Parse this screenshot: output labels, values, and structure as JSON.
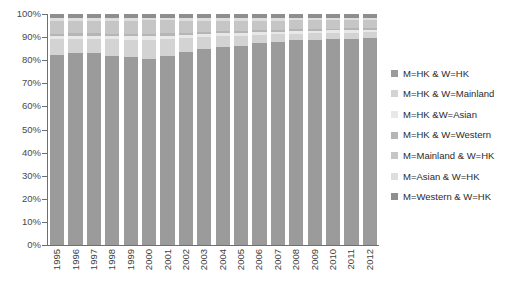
{
  "chart_data": {
    "type": "bar",
    "stacked": true,
    "stack_mode": "percent",
    "title": "",
    "subtitle": "",
    "xlabel": "",
    "ylabel": "",
    "ylim": [
      0,
      100
    ],
    "ytick_labels": [
      "100%",
      "90%",
      "80%",
      "70%",
      "60%",
      "50%",
      "40%",
      "30%",
      "20%",
      "10%",
      "0%"
    ],
    "ytick_values": [
      100,
      90,
      80,
      70,
      60,
      50,
      40,
      30,
      20,
      10,
      0
    ],
    "grid": false,
    "legend_position": "right",
    "categories": [
      "1995",
      "1996",
      "1997",
      "1998",
      "1999",
      "2000",
      "2001",
      "2002",
      "2003",
      "2004",
      "2005",
      "2006",
      "2007",
      "2008",
      "2009",
      "2010",
      "2011",
      "2012"
    ],
    "series": [
      {
        "name": "M=HK & W=HK",
        "color": "#9b9b9b",
        "values": [
          82.3,
          83.0,
          83.2,
          82.0,
          81.5,
          80.6,
          81.8,
          83.6,
          84.8,
          85.6,
          86.3,
          87.4,
          88.0,
          88.6,
          88.9,
          89.2,
          89.4,
          89.6
        ]
      },
      {
        "name": "M=HK & W=Mainland",
        "color": "#d3d3d3",
        "values": [
          6.8,
          6.2,
          6.0,
          7.0,
          7.4,
          8.2,
          7.4,
          6.0,
          5.2,
          4.7,
          4.3,
          3.6,
          3.2,
          2.9,
          2.8,
          2.7,
          2.6,
          2.5
        ]
      },
      {
        "name": "M=HK &W=Asian",
        "color": "#e8e8e8",
        "values": [
          1.4,
          1.4,
          1.4,
          1.5,
          1.5,
          1.5,
          1.5,
          1.4,
          1.3,
          1.3,
          1.2,
          1.2,
          1.1,
          1.1,
          1.0,
          1.0,
          1.0,
          1.0
        ]
      },
      {
        "name": "M=HK & W=Western",
        "color": "#b5b5b5",
        "values": [
          1.0,
          1.0,
          1.0,
          1.0,
          1.0,
          1.0,
          1.0,
          0.9,
          0.9,
          0.9,
          0.9,
          0.8,
          0.8,
          0.8,
          0.8,
          0.8,
          0.8,
          0.8
        ]
      },
      {
        "name": "M=Mainland & W=HK",
        "color": "#c6c6c6",
        "values": [
          5.6,
          5.5,
          5.5,
          5.7,
          5.8,
          6.0,
          5.6,
          5.3,
          4.9,
          4.7,
          4.5,
          4.2,
          4.1,
          3.9,
          3.8,
          3.7,
          3.6,
          3.5
        ]
      },
      {
        "name": "M=Asian & W=HK",
        "color": "#dedede",
        "values": [
          1.2,
          1.2,
          1.2,
          1.2,
          1.2,
          1.1,
          1.1,
          1.1,
          1.1,
          1.1,
          1.1,
          1.1,
          1.1,
          1.0,
          1.0,
          1.0,
          1.0,
          1.0
        ]
      },
      {
        "name": "M=Western & W=HK",
        "color": "#8e8e8e",
        "values": [
          1.7,
          1.7,
          1.7,
          1.6,
          1.6,
          1.6,
          1.6,
          1.7,
          1.8,
          1.7,
          1.7,
          1.7,
          1.7,
          1.7,
          1.7,
          1.6,
          1.6,
          1.6
        ]
      }
    ]
  },
  "axis": {
    "line_color": "#6f6f6f"
  }
}
